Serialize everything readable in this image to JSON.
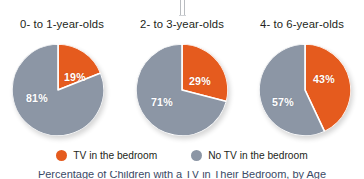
{
  "colors": {
    "tv": "#e55b1e",
    "no_tv": "#8c96a5",
    "text": "#231f20",
    "background": "#ffffff",
    "separator": "#ffffff",
    "caption": "#3b4a66"
  },
  "fold_marks": 2,
  "chart_data": {
    "type": "pie",
    "title": "",
    "legend_position": "bottom",
    "legend": [
      "TV in the bedroom",
      "No TV in the bedroom"
    ],
    "series_colors": [
      "#e55b1e",
      "#8c96a5"
    ],
    "charts": [
      {
        "title": "0- to 1-year-olds",
        "labels": [
          "TV in the bedroom",
          "No TV in the bedroom"
        ],
        "values": [
          19,
          81
        ],
        "value_labels": [
          "19%",
          "81%"
        ]
      },
      {
        "title": "2- to 3-year-olds",
        "labels": [
          "TV in the bedroom",
          "No TV in the bedroom"
        ],
        "values": [
          29,
          71
        ],
        "value_labels": [
          "29%",
          "71%"
        ]
      },
      {
        "title": "4- to 6-year-olds",
        "labels": [
          "TV in the bedroom",
          "No TV in the bedroom"
        ],
        "values": [
          43,
          57
        ],
        "value_labels": [
          "43%",
          "57%"
        ]
      }
    ]
  },
  "legend": {
    "items": [
      {
        "label": "TV in the bedroom",
        "color": "#e55b1e",
        "icon": "circle-swatch-icon"
      },
      {
        "label": "No TV in the bedroom",
        "color": "#8c96a5",
        "icon": "circle-swatch-icon"
      }
    ]
  },
  "caption": {
    "text": "Percentage of Children with a TV in Their Bedroom, by Age",
    "clipped": true
  }
}
